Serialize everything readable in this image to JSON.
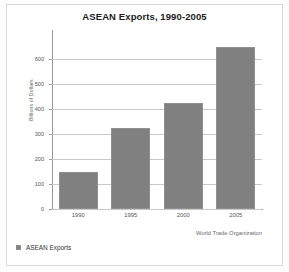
{
  "chart_data": {
    "type": "bar",
    "title": "ASEAN Exports, 1990-2005",
    "xlabel": "",
    "ylabel": "Billions of Dollars",
    "categories": [
      "1990",
      "1995",
      "2000",
      "2005"
    ],
    "values": [
      150,
      325,
      425,
      650
    ],
    "series": [
      {
        "name": "ASEAN Exports",
        "values": [
          150,
          325,
          425,
          650
        ]
      }
    ],
    "ylim": [
      0,
      700
    ],
    "yticks": [
      0,
      100,
      200,
      300,
      400,
      500,
      600
    ],
    "ytick_labels": [
      "0",
      "100",
      "200",
      "300",
      "400",
      "500",
      "600"
    ],
    "grid": true,
    "legend_position": "bottom-left",
    "bar_color": "#808080",
    "annotations": [
      "World Trade Organization"
    ]
  },
  "legend": {
    "entries": [
      {
        "label": "ASEAN Exports",
        "color": "#808080",
        "marker": "square-swatch"
      }
    ]
  },
  "source": {
    "text": "World Trade Organization"
  }
}
